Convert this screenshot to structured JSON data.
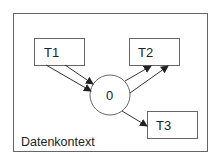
{
  "diagram": {
    "context": {
      "label": "Datenkontext",
      "x": 13,
      "y": 13,
      "w": 194,
      "h": 138
    },
    "nodes": [
      {
        "id": "T1",
        "label": "T1",
        "shape": "rect",
        "x": 34,
        "y": 38,
        "w": 50,
        "h": 27
      },
      {
        "id": "T2",
        "label": "T2",
        "shape": "rect",
        "x": 129,
        "y": 38,
        "w": 50,
        "h": 27
      },
      {
        "id": "T3",
        "label": "T3",
        "shape": "rect",
        "x": 147,
        "y": 111,
        "w": 50,
        "h": 27
      },
      {
        "id": "O",
        "label": "0",
        "shape": "circle",
        "cx": 110,
        "cy": 95,
        "r": 20
      }
    ],
    "edges": [
      {
        "from": "T1",
        "to": "O",
        "x1": 46,
        "y1": 65,
        "x2": 91,
        "y2": 91
      },
      {
        "from": "T1",
        "to": "O",
        "x1": 65,
        "y1": 65,
        "x2": 93,
        "y2": 84
      },
      {
        "from": "O",
        "to": "T2",
        "x1": 125,
        "y1": 81,
        "x2": 151,
        "y2": 66
      },
      {
        "from": "O",
        "to": "T2",
        "x1": 130,
        "y1": 93,
        "x2": 168,
        "y2": 66
      },
      {
        "from": "O",
        "to": "T3",
        "x1": 122,
        "y1": 111,
        "x2": 147,
        "y2": 126
      }
    ],
    "colors": {
      "stroke": "#555555",
      "text": "#222222",
      "background": "#ffffff"
    }
  }
}
